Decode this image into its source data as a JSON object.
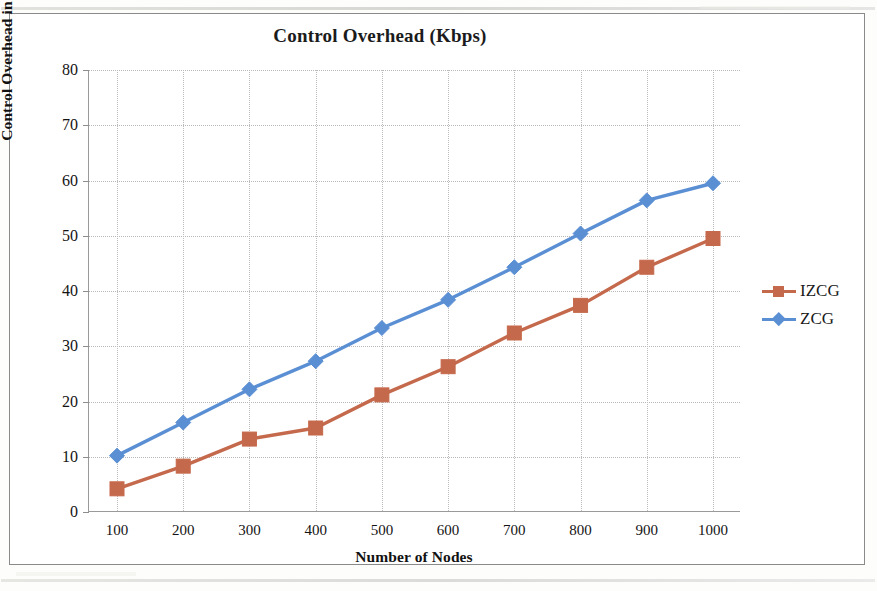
{
  "chart_data": {
    "type": "line",
    "title": "Control Overhead (Kbps)",
    "xlabel": "Number of Nodes",
    "ylabel": "Control Overhead in s",
    "x": [
      100,
      200,
      300,
      400,
      500,
      600,
      700,
      800,
      900,
      1000
    ],
    "categories": [
      "100",
      "200",
      "300",
      "400",
      "500",
      "600",
      "700",
      "800",
      "900",
      "1000"
    ],
    "series": [
      {
        "name": "IZCG",
        "color": "#C5694C",
        "marker": "square",
        "values": [
          4.2,
          8.3,
          13.2,
          15.2,
          21.2,
          26.3,
          32.4,
          37.4,
          44.3,
          49.5
        ]
      },
      {
        "name": "ZCG",
        "color": "#5B8FD4",
        "marker": "diamond",
        "values": [
          10.2,
          16.2,
          22.2,
          27.3,
          33.3,
          38.4,
          44.3,
          50.4,
          56.4,
          59.5
        ]
      }
    ],
    "ylim": [
      0,
      80
    ],
    "yticks": [
      0,
      10,
      20,
      30,
      40,
      50,
      60,
      70,
      80
    ],
    "ytick_labels": [
      "0",
      "10",
      "20",
      "30",
      "40",
      "50",
      "60",
      "70",
      "80"
    ],
    "xtick_labels": [
      "100",
      "200",
      "300",
      "400",
      "500",
      "600",
      "700",
      "800",
      "900",
      "1000"
    ],
    "grid": true,
    "grid_style": "dotted",
    "legend_position": "right",
    "legend": [
      "IZCG",
      "ZCG"
    ]
  },
  "figure": {
    "background_color": "#FFFFFF",
    "border_color": "#8A8A8A"
  }
}
